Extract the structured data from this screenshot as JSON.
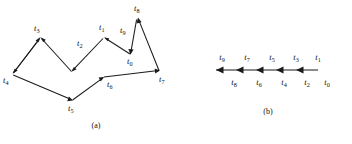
{
  "figure": {
    "background_color": "#ffffff",
    "ink_color": "#1b1b1b",
    "panels": [
      {
        "id": "panel-a",
        "caption": "(a)",
        "caption_x": 96,
        "caption_y": 128,
        "type": "zigzag-path-diagram",
        "description": "Open polyline with directed segments labelled t0 through t9",
        "vertices": [
          {
            "name": "v-t4",
            "x": 12,
            "y": 74
          },
          {
            "name": "v-t3",
            "x": 40,
            "y": 37
          },
          {
            "name": "v-valley1",
            "x": 72,
            "y": 72
          },
          {
            "name": "v-t1",
            "x": 104,
            "y": 37
          },
          {
            "name": "v-t0",
            "x": 131,
            "y": 55
          },
          {
            "name": "v-t8",
            "x": 138,
            "y": 18
          },
          {
            "name": "v-t7",
            "x": 160,
            "y": 72
          },
          {
            "name": "v-t6",
            "x": 104,
            "y": 78
          },
          {
            "name": "v-t5",
            "x": 72,
            "y": 101
          }
        ],
        "labels": [
          {
            "name": "label-t3",
            "base": "t",
            "sub": "3",
            "x": 34,
            "y": 31
          },
          {
            "name": "label-t4",
            "base": "t",
            "sub": "4",
            "x": 3,
            "y": 83
          },
          {
            "name": "label-t2",
            "base": "t",
            "sub": "2",
            "x": 77,
            "y": 46
          },
          {
            "name": "label-t1",
            "base": "t",
            "sub": "1",
            "x": 99,
            "y": 30
          },
          {
            "name": "label-t9",
            "base": "t",
            "sub": "9",
            "x": 120,
            "y": 33
          },
          {
            "name": "label-t8",
            "base": "t",
            "sub": "8",
            "x": 134,
            "y": 11
          },
          {
            "name": "label-t0",
            "base": "t",
            "sub": "0",
            "x": 127,
            "y": 64
          },
          {
            "name": "label-t7",
            "base": "t",
            "sub": "7",
            "x": 159,
            "y": 82
          },
          {
            "name": "label-t6",
            "base": "t",
            "sub": "6",
            "x": 107,
            "y": 87
          },
          {
            "name": "label-t5",
            "base": "t",
            "sub": "5",
            "x": 68,
            "y": 111
          }
        ]
      },
      {
        "id": "panel-b",
        "caption": "(b)",
        "caption_x": 268,
        "caption_y": 114,
        "type": "directed-axis",
        "description": "Horizontal line with left-pointing arrowheads; ten time labels alternating above and below",
        "axis": {
          "x_start": 216,
          "x_end": 318,
          "y": 70,
          "arrow_direction": "left"
        },
        "tick_count": 5,
        "labels_above": [
          {
            "name": "label-t9",
            "base": "t",
            "sub": "9",
            "x": 222,
            "y": 60
          },
          {
            "name": "label-t7",
            "base": "t",
            "sub": "7",
            "x": 247,
            "y": 60
          },
          {
            "name": "label-t5",
            "base": "t",
            "sub": "5",
            "x": 272,
            "y": 60
          },
          {
            "name": "label-t3",
            "base": "t",
            "sub": "3",
            "x": 296,
            "y": 60
          },
          {
            "name": "label-t1",
            "base": "t",
            "sub": "1",
            "x": 318,
            "y": 60
          }
        ],
        "labels_below": [
          {
            "name": "label-t8",
            "base": "t",
            "sub": "8",
            "x": 234,
            "y": 85
          },
          {
            "name": "label-t6",
            "base": "t",
            "sub": "6",
            "x": 259,
            "y": 85
          },
          {
            "name": "label-t4",
            "base": "t",
            "sub": "4",
            "x": 284,
            "y": 85
          },
          {
            "name": "label-t2",
            "base": "t",
            "sub": "2",
            "x": 307,
            "y": 85
          },
          {
            "name": "label-t0",
            "base": "t",
            "sub": "0",
            "x": 327,
            "y": 85
          }
        ]
      }
    ]
  }
}
